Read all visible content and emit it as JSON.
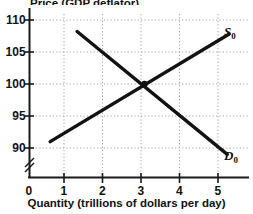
{
  "chart_data": {
    "type": "line",
    "title": "",
    "xlabel": "Quantity (trillions of dollars per day)",
    "ylabel": "Price (GDP deflator)",
    "xlim": [
      0,
      5.75
    ],
    "ylim": [
      88,
      110.5
    ],
    "grid": true,
    "legend_position": "inline-right",
    "xticks": [
      0,
      1,
      2,
      3,
      4,
      5
    ],
    "xtick_labels": [
      "0",
      "1",
      "2",
      "3",
      "4",
      "5"
    ],
    "yticks": [
      90,
      95,
      100,
      105,
      110
    ],
    "ytick_labels": [
      "90",
      "95",
      "100",
      "105",
      "110"
    ],
    "y_axis_break": true,
    "equilibrium": {
      "x": 3,
      "y": 100
    },
    "series": [
      {
        "name": "S0",
        "label": "S",
        "subscript": "0",
        "kind": "supply",
        "color": "#121212",
        "points": [
          {
            "x": 0.55,
            "y": 91.0
          },
          {
            "x": 5.2,
            "y": 107.8
          }
        ]
      },
      {
        "name": "D0",
        "label": "D",
        "subscript": "0",
        "kind": "demand",
        "color": "#121212",
        "points": [
          {
            "x": 1.25,
            "y": 108.2
          },
          {
            "x": 5.15,
            "y": 89.0
          }
        ]
      }
    ]
  },
  "axes": {
    "x_title": "Quantity (trillions of dollars per day)",
    "y_title": "Price (GDP deflator)"
  },
  "labels": {
    "y_110": "110",
    "y_105": "105",
    "y_100": "100",
    "y_95": "95",
    "y_90": "90",
    "x_0": "0",
    "x_1": "1",
    "x_2": "2",
    "x_3": "3",
    "x_4": "4",
    "x_5": "5",
    "supply": "S",
    "supply_sub": "0",
    "demand": "D",
    "demand_sub": "0"
  },
  "colors": {
    "curve": "#121212",
    "axis": "#1a1a1a",
    "grid": "#9a9a9a",
    "background": "#ffffff"
  }
}
